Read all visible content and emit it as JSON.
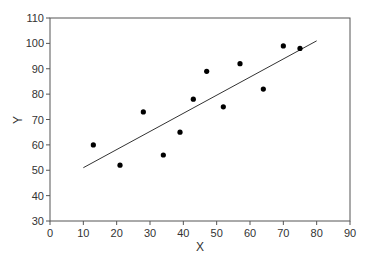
{
  "chart_data": {
    "type": "scatter",
    "title": "",
    "xlabel": "X",
    "ylabel": "Y",
    "xlim": [
      0,
      90
    ],
    "ylim": [
      30,
      110
    ],
    "xticks": [
      0,
      10,
      20,
      30,
      40,
      50,
      60,
      70,
      80,
      90
    ],
    "yticks": [
      30,
      40,
      50,
      60,
      70,
      80,
      90,
      100,
      110
    ],
    "grid": false,
    "legend": null,
    "series": [
      {
        "name": "data",
        "marker": "circle",
        "color": "#000000",
        "points": [
          {
            "x": 13,
            "y": 60
          },
          {
            "x": 21,
            "y": 52
          },
          {
            "x": 28,
            "y": 73
          },
          {
            "x": 34,
            "y": 56
          },
          {
            "x": 39,
            "y": 65
          },
          {
            "x": 43,
            "y": 78
          },
          {
            "x": 47,
            "y": 89
          },
          {
            "x": 52,
            "y": 75
          },
          {
            "x": 57,
            "y": 92
          },
          {
            "x": 64,
            "y": 82
          },
          {
            "x": 70,
            "y": 99
          },
          {
            "x": 75,
            "y": 98
          }
        ]
      }
    ],
    "fit_line": {
      "name": "regression line",
      "color": "#333333",
      "x": [
        10,
        80
      ],
      "y": [
        51,
        101
      ]
    }
  }
}
